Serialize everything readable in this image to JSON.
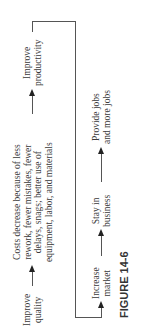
{
  "figure": {
    "caption": "FIGURE 14-6",
    "nodes": {
      "improve_quality": "Improve quality",
      "costs_decrease": [
        "Costs decrease because of less",
        "rework, fewer mistakes, fewer",
        "delays, snags; better use of",
        "equipment, labor, and materials"
      ],
      "improve_productivity": "Improve productivity",
      "increase_market": "Increase market",
      "stay_in_business": "Stay in business",
      "provide_jobs": "Provide jobs and more jobs"
    },
    "labels": {
      "iq1": "Improve",
      "iq2": "quality",
      "cd1": "Costs decrease because of less",
      "cd2": "rework, fewer mistakes, fewer",
      "cd3": "delays, snags; better use of",
      "cd4": "equipment, labor, and materials",
      "ip1": "Improve",
      "ip2": "productivity",
      "im1": "Increase",
      "im2": "market",
      "sb1": "Stay in",
      "sb2": "business",
      "pj1": "Provide jobs",
      "pj2": "and more jobs"
    }
  }
}
